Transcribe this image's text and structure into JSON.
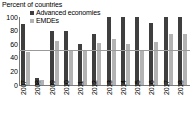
{
  "chart_data": {
    "type": "bar",
    "title": "Percent of countries",
    "subtitle": "",
    "xlabel": "",
    "ylabel": "",
    "ylim": [
      0,
      100
    ],
    "yticks": [
      100,
      80,
      60,
      40,
      20,
      0
    ],
    "grid": false,
    "legend_position": "top-left",
    "reference_line": {
      "value": 50,
      "label": "",
      "color": "#9a9a9a"
    },
    "categories": [
      "2007",
      "2008",
      "2009",
      "2010",
      "2011",
      "2012",
      "2013",
      "2014",
      "2015",
      "2016",
      "2017",
      "2018"
    ],
    "series": [
      {
        "name": "Advanced economies",
        "color": "#3f3f3f",
        "values": [
          90,
          10,
          79,
          79,
          60,
          75,
          100,
          100,
          100,
          91,
          100,
          100
        ]
      },
      {
        "name": "EMDEs",
        "color": "#b3b3b3",
        "values": [
          48,
          7,
          65,
          50,
          50,
          62,
          68,
          61,
          50,
          63,
          75,
          75
        ]
      }
    ]
  }
}
